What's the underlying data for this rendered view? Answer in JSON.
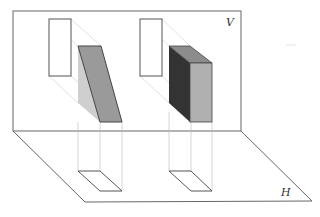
{
  "diagram": {
    "type": "orthographic-projection",
    "planes": {
      "vertical": {
        "label": "V"
      },
      "horizontal": {
        "label": "H"
      }
    },
    "objects": [
      {
        "name": "inclined-prism",
        "description": "prism with inclined face projected onto V and H planes"
      },
      {
        "name": "rectangular-box",
        "description": "rectangular box projected onto V and H planes"
      }
    ],
    "colors": {
      "plane_stroke": "#666666",
      "dark_face": "#3a3a3a",
      "mid_face": "#9a9a9a",
      "light_face": "#c8c8c8",
      "box_top": "#8c8c8c",
      "box_front": "#b0b0b0"
    }
  }
}
